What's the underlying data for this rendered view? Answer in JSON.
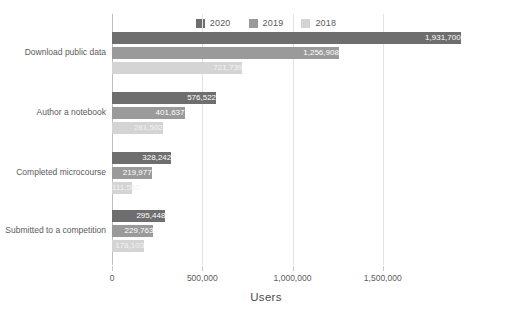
{
  "chart_data": {
    "type": "bar",
    "orientation": "horizontal",
    "title": "",
    "xlabel": "Users",
    "ylabel": "",
    "xlim": [
      0,
      1950000
    ],
    "xticks": [
      0,
      500000,
      1000000,
      1500000
    ],
    "xtick_labels": [
      "0",
      "500,000",
      "1,000,000",
      "1,500,000"
    ],
    "grid": true,
    "legend_position": "top-center",
    "categories": [
      "Download public data",
      "Author a notebook",
      "Completed microcourse",
      "Submitted to a competition"
    ],
    "series": [
      {
        "name": "2020",
        "color": "#6e6e6e",
        "values": [
          1931700,
          576522,
          328242,
          295448
        ],
        "labels": [
          "1,931,700",
          "576,522",
          "328,242",
          "295,448"
        ]
      },
      {
        "name": "2019",
        "color": "#9a9a9a",
        "values": [
          1256908,
          401637,
          219977,
          229763
        ],
        "labels": [
          "1,256,908",
          "401,637",
          "219,977",
          "229,763"
        ]
      },
      {
        "name": "2018",
        "color": "#d4d4d4",
        "values": [
          721739,
          281502,
          111552,
          178103
        ],
        "labels": [
          "721,739",
          "281,502",
          "111,552",
          "178,103"
        ]
      }
    ]
  },
  "legend": {
    "items": [
      {
        "label": "2020",
        "color": "#6e6e6e"
      },
      {
        "label": "2019",
        "color": "#9a9a9a"
      },
      {
        "label": "2018",
        "color": "#d4d4d4"
      }
    ]
  },
  "axis": {
    "x_title": "Users",
    "tick_labels": [
      "0",
      "500,000",
      "1,000,000",
      "1,500,000"
    ]
  },
  "categories": {
    "items": [
      "Download public data",
      "Author a notebook",
      "Completed microcourse",
      "Submitted to a competition"
    ]
  }
}
